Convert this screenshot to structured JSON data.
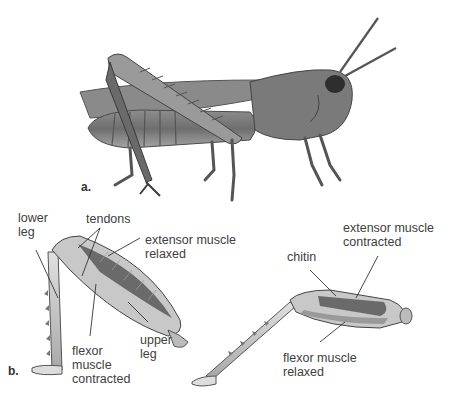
{
  "figure": {
    "panel_a": {
      "label": "a.",
      "subject": "grasshopper photograph"
    },
    "panel_b": {
      "label": "b.",
      "flexed_leg": {
        "labels": {
          "lower_leg": "lower\nleg",
          "tendons": "tendons",
          "extensor": "extensor muscle\nrelaxed",
          "upper_leg": "upper\nleg",
          "flexor": "flexor\nmuscle\ncontracted"
        }
      },
      "extended_leg": {
        "labels": {
          "chitin": "chitin",
          "extensor": "extensor muscle\ncontracted",
          "flexor": "flexor muscle\nrelaxed"
        }
      }
    },
    "colors": {
      "ink": "#404040",
      "body_dark": "#5a5a5a",
      "body_mid": "#8a8a8a",
      "body_light": "#c8c8c8"
    }
  }
}
